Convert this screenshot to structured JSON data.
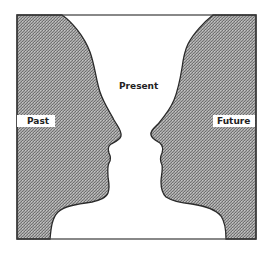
{
  "figure": {
    "colors": {
      "background": "#ffffff",
      "face_fill": "#9a9a9a",
      "stipple_dark": "#6e6e6e",
      "stipple_light": "#c4c4c4",
      "outline": "#2a2a2a"
    },
    "frame": {
      "x": 17,
      "y": 15,
      "width": 239,
      "height": 224
    }
  },
  "labels": {
    "present": "Present",
    "past": "Past",
    "future": "Future"
  },
  "regions": {
    "left_face": "Past",
    "center_vase": "Present",
    "right_face": "Future"
  }
}
